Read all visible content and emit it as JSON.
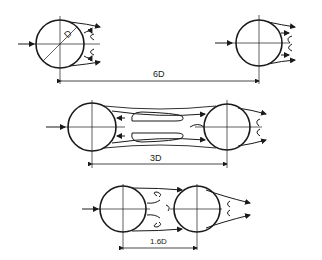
{
  "diagram": {
    "configurations": [
      {
        "id": "6D",
        "spacing_label": "6D",
        "diameter_label": "D"
      },
      {
        "id": "3D",
        "spacing_label": "3D"
      },
      {
        "id": "1.6D",
        "spacing_label": "1.6D"
      }
    ],
    "colors": {
      "stroke": "#1a1a1a",
      "background": "#ffffff"
    }
  }
}
